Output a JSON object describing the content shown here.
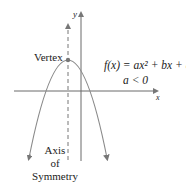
{
  "diagram": {
    "labels": {
      "vertex": "Vertex",
      "function": "f(x) = ax² + bx + c,",
      "condition": "a < 0",
      "axis_of_symmetry_line1": "Axis",
      "axis_of_symmetry_line2": "of",
      "axis_of_symmetry_line3": "Symmetry",
      "x_axis": "x",
      "y_axis": "y"
    },
    "colors": {
      "curve": "#8a8a8a",
      "axes": "#6a6a6a",
      "text": "#222222"
    }
  }
}
